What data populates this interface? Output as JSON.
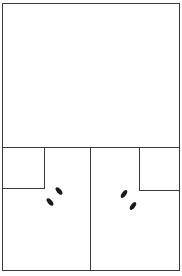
{
  "diagram": {
    "colors": {
      "stroke": "#3a3a3a",
      "footprint": "#1a1a1a",
      "background": "#ffffff"
    },
    "icons": [
      "footprint-icon",
      "footprint-icon",
      "footprint-icon",
      "footprint-icon"
    ]
  }
}
